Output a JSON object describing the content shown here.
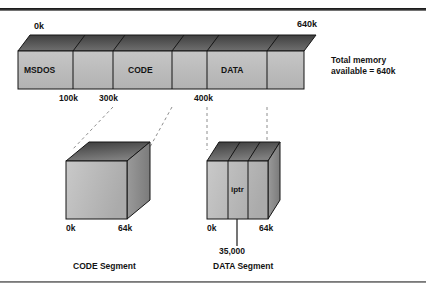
{
  "figure": {
    "kind": "memory-layout-diagram",
    "frame": {
      "top_rule": true,
      "bottom_rule": true
    }
  },
  "memory_bar": {
    "start_label": "0k",
    "end_label": "640k",
    "segments": [
      {
        "name": "MSDOS",
        "label": "MSDOS",
        "start": "0k",
        "end": "100k"
      },
      {
        "name": "free-1",
        "label": "",
        "start": "100k",
        "end": "300k"
      },
      {
        "name": "CODE",
        "label": "CODE",
        "start": "300k",
        "end": "400k"
      },
      {
        "name": "free-2",
        "label": "",
        "start": "400k",
        "end": "400k"
      },
      {
        "name": "DATA",
        "label": "DATA",
        "start": "400k",
        "end": "500k"
      },
      {
        "name": "free-3",
        "label": "",
        "start": "500k",
        "end": "640k"
      }
    ],
    "tick_labels": [
      "100k",
      "300k",
      "400k"
    ],
    "note_line_1": "Total memory",
    "note_line_2": "available = 640k"
  },
  "code_segment": {
    "caption": "CODE Segment",
    "start_label": "0k",
    "end_label": "64k",
    "slices": 1
  },
  "data_segment": {
    "caption": "DATA Segment",
    "start_label": "0k",
    "end_label": "64k",
    "slices": 3,
    "pointer_label": "iptr",
    "pointer_address": "35,000"
  },
  "colors": {
    "face": "#b9b9b9",
    "face_light": "#cfcfcf",
    "top_dark": "#4e4e4e",
    "top_light": "#8d8d8d",
    "side": "#8a8a8a",
    "outline": "#1a1a1a",
    "text": "#131313",
    "dashed": "#8e8e8e"
  }
}
